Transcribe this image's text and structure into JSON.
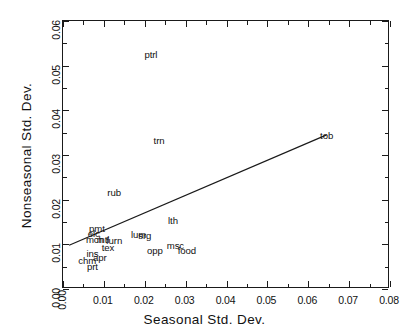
{
  "chart_data": {
    "type": "scatter",
    "title": "",
    "xlabel": "Seasonal Std. Dev.",
    "ylabel": "Nonseasonal  Std. Dev.",
    "xlim": [
      0.0,
      0.08
    ],
    "ylim": [
      0.0,
      0.06
    ],
    "xticks": [
      "0.00",
      "0.01",
      "0.02",
      "0.03",
      "0.04",
      "0.05",
      "0.06",
      "0.07",
      "0.08"
    ],
    "xtick_values": [
      0.0,
      0.01,
      0.02,
      0.03,
      0.04,
      0.05,
      0.06,
      0.07,
      0.08
    ],
    "yticks": [
      "0.00",
      "0.01",
      "0.02",
      "0.03",
      "0.04",
      "0.05",
      "0.06"
    ],
    "ytick_values": [
      0.0,
      0.01,
      0.02,
      0.03,
      0.04,
      0.05,
      0.06
    ],
    "minor_tick_step_x": 0.005,
    "minor_tick_step_y": 0.005,
    "grid": false,
    "legend": null,
    "marker_style": "text-label",
    "points": [
      {
        "label": "ptrl",
        "x": 0.0215,
        "y": 0.0525
      },
      {
        "label": "tob",
        "x": 0.0645,
        "y": 0.0343
      },
      {
        "label": "trn",
        "x": 0.0235,
        "y": 0.0332
      },
      {
        "label": "rub",
        "x": 0.0125,
        "y": 0.0215
      },
      {
        "label": "lth",
        "x": 0.0269,
        "y": 0.0152
      },
      {
        "label": "pmt",
        "x": 0.0083,
        "y": 0.0135
      },
      {
        "label": "elc",
        "x": 0.0075,
        "y": 0.0123
      },
      {
        "label": "lum",
        "x": 0.0185,
        "y": 0.012
      },
      {
        "label": "srg",
        "x": 0.02,
        "y": 0.0118
      },
      {
        "label": "mch",
        "x": 0.0078,
        "y": 0.011
      },
      {
        "label": "mtl",
        "x": 0.0098,
        "y": 0.011
      },
      {
        "label": "furn",
        "x": 0.0125,
        "y": 0.0108
      },
      {
        "label": "msc",
        "x": 0.0275,
        "y": 0.0097
      },
      {
        "label": "tex",
        "x": 0.011,
        "y": 0.0092
      },
      {
        "label": "food",
        "x": 0.0303,
        "y": 0.0086
      },
      {
        "label": "opp",
        "x": 0.0225,
        "y": 0.0085
      },
      {
        "label": "ins",
        "x": 0.0072,
        "y": 0.0078
      },
      {
        "label": "apr",
        "x": 0.009,
        "y": 0.007
      },
      {
        "label": "chm",
        "x": 0.0059,
        "y": 0.0062
      },
      {
        "label": "prt",
        "x": 0.0072,
        "y": 0.005
      }
    ],
    "fit_line": {
      "type": "line",
      "x0": 0.0015,
      "y0": 0.0098,
      "x1": 0.0645,
      "y1": 0.0345
    }
  }
}
